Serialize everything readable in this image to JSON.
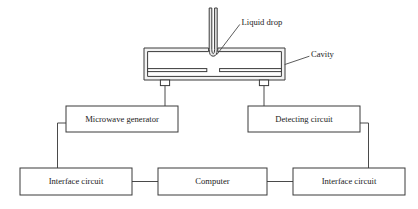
{
  "diagram": {
    "colors": {
      "line": "#3a3a3a",
      "connector": "#4a4a4a",
      "cavity_wall_fill": "#f2f2f2",
      "nozzle_fill": "#e8e8e8",
      "background": "#ffffff",
      "text": "#1c1c1c"
    },
    "callouts": [
      {
        "id": "liquid-drop",
        "label": "Liquid drop"
      },
      {
        "id": "cavity",
        "label": "Cavity"
      }
    ],
    "blocks": [
      {
        "id": "microwave-generator",
        "label": "Microwave generator"
      },
      {
        "id": "detecting-circuit",
        "label": "Detecting circuit"
      },
      {
        "id": "interface-circuit-left",
        "label": "Interface circuit"
      },
      {
        "id": "computer",
        "label": "Computer"
      },
      {
        "id": "interface-circuit-right",
        "label": "Interface circuit"
      }
    ]
  }
}
